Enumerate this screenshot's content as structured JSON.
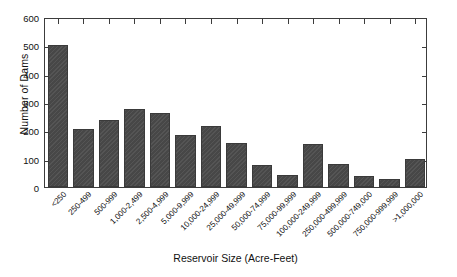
{
  "chart_data": {
    "type": "bar",
    "title": "",
    "xlabel": "Reservoir Size (Acre-Feet)",
    "ylabel": "Number of Dams",
    "categories": [
      "<250",
      "250-499",
      "500-999",
      "1,000-2,499",
      "2,500-4,999",
      "5,000-9,999",
      "10,000-24,999",
      "25,000-49,999",
      "50,000-74,999",
      "75,000-99,999",
      "100,000-249,999",
      "250,000-499,999",
      "500,000-749,000",
      "750,000-999,999",
      ">1,000,000"
    ],
    "values": [
      500,
      205,
      235,
      275,
      260,
      185,
      215,
      155,
      78,
      43,
      153,
      82,
      38,
      28,
      98
    ],
    "ylim": [
      0,
      600
    ],
    "yticks": [
      0,
      100,
      200,
      300,
      400,
      500,
      600
    ],
    "ytick_labels": [
      "0",
      "100",
      "200",
      "300",
      "400",
      "500",
      "600"
    ],
    "grid": false,
    "legend": null,
    "bar_color": "#4b4b4b",
    "axis_color": "#3c3c3c",
    "background_color": "#ffffff"
  }
}
